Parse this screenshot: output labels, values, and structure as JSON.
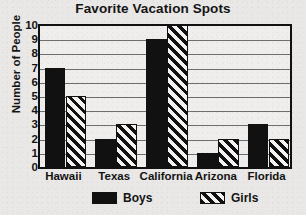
{
  "chart_data": {
    "type": "bar",
    "title": "Favorite Vacation Spots",
    "xlabel": "",
    "ylabel": "Number of People",
    "categories": [
      "Hawaii",
      "Texas",
      "California",
      "Arizona",
      "Florida"
    ],
    "series": [
      {
        "name": "Boys",
        "values": [
          7,
          2,
          9,
          1,
          3
        ],
        "fill": "solid-black",
        "color": "#111111"
      },
      {
        "name": "Girls",
        "values": [
          5,
          3,
          10,
          2,
          2
        ],
        "fill": "diagonal-hatch",
        "color": "#111111"
      }
    ],
    "ylim": [
      0,
      10
    ],
    "yticks": [
      10,
      9,
      8,
      7,
      6,
      5,
      4,
      3,
      2,
      1,
      0
    ],
    "grid": "horizontal",
    "legend_position": "bottom",
    "legend_entries": [
      "Boys",
      "Girls"
    ]
  },
  "colors": {
    "background": "#e9e8e6",
    "plot_background": "#efeeec",
    "ink": "#111111",
    "gridline": "#6d6d6d"
  }
}
